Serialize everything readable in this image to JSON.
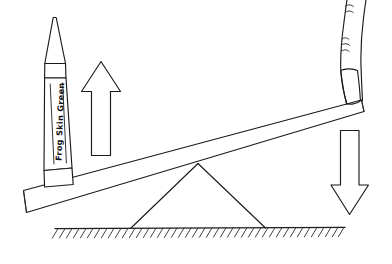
{
  "scene": {
    "title": "Lever diagram with crayon load and finger effort",
    "background_color": "#ffffff",
    "ink_color": "#1b1b1b",
    "width": 392,
    "height": 264
  },
  "crayon": {
    "label": "Frog Skin Green",
    "name": "crayon",
    "orientation": "vertical",
    "tip_direction": "up"
  },
  "arrows": {
    "up": {
      "name": "up-arrow",
      "direction": "up",
      "meaning": "load rises"
    },
    "down": {
      "name": "down-arrow",
      "direction": "down",
      "meaning": "effort pushes down"
    }
  },
  "lever": {
    "name": "plank",
    "description": "tilted board resting on fulcrum"
  },
  "fulcrum": {
    "name": "fulcrum",
    "shape": "triangle"
  },
  "ground": {
    "name": "ground",
    "style": "hatched line"
  },
  "hand": {
    "name": "finger",
    "description": "finger pressing down on right end of plank"
  }
}
